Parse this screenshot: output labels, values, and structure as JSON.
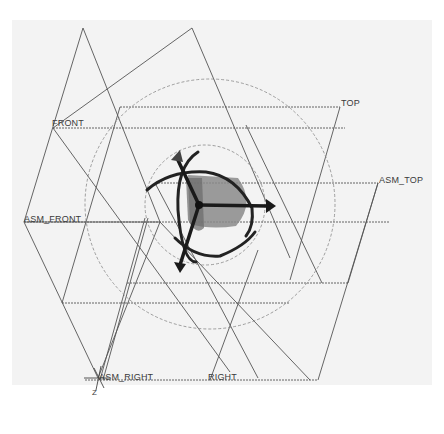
{
  "viewport": {
    "background": "#f3f3f3",
    "datum_planes": [
      {
        "name": "TOP",
        "label": "TOP"
      },
      {
        "name": "FRONT",
        "label": "FRONT"
      },
      {
        "name": "ASM_TOP",
        "label": "ASM_TOP"
      },
      {
        "name": "ASM_FRONT",
        "label": "ASM_FRONT"
      },
      {
        "name": "ASM_RIGHT",
        "label": "ASM_RIGHT"
      },
      {
        "name": "RIGHT",
        "label": "RIGHT"
      }
    ],
    "coordinate_system": {
      "axis_label": "Z"
    },
    "colors": {
      "line": "#555555",
      "dashed": "#777777",
      "dragger": "#222222",
      "fill": "#8a8a8a"
    }
  }
}
